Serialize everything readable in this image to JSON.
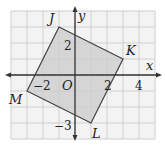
{
  "diagram": {
    "type": "coordinate-plane-polygon",
    "grid": {
      "x_min": -4,
      "x_max": 5,
      "y_min": -4,
      "y_max": 4,
      "unit_px": 16,
      "origin_px": [
        75,
        75
      ]
    },
    "axes": {
      "x_label": "x",
      "y_label": "y",
      "origin_label": "O"
    },
    "tick_labels": [
      {
        "text": "2",
        "axis": "y",
        "value": 2
      },
      {
        "text": "−3",
        "axis": "y",
        "value": -3
      },
      {
        "text": "−2",
        "axis": "x",
        "value": -2
      },
      {
        "text": "2",
        "axis": "x",
        "value": 2
      },
      {
        "text": "4",
        "axis": "x",
        "value": 4
      }
    ],
    "polygon": {
      "name": "JKLM",
      "fill": "#cfcfcf",
      "stroke": "#444444",
      "vertices": [
        {
          "label": "J",
          "x": -1,
          "y": 3
        },
        {
          "label": "K",
          "x": 3,
          "y": 1
        },
        {
          "label": "L",
          "x": 1,
          "y": -3
        },
        {
          "label": "M",
          "x": -3,
          "y": -1
        }
      ]
    },
    "colors": {
      "grid": "#cfcfcf",
      "background": "#f3f3f3",
      "axis": "#333333"
    }
  }
}
